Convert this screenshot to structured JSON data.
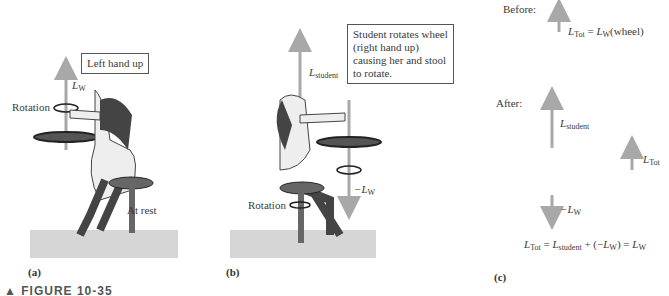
{
  "panel_a": {
    "letter": "(a)",
    "callout": "Left hand up",
    "rotation_label": "Rotation",
    "vector_label": "L",
    "vector_sub": "W",
    "state_label": "At rest"
  },
  "panel_b": {
    "letter": "(b)",
    "callout_lines": [
      "Student rotates wheel",
      "(right hand up)",
      "causing her and stool",
      "to rotate."
    ],
    "student_vector": "L",
    "student_sub": "student",
    "wheel_vector": "−L",
    "wheel_sub": "W",
    "rotation_label": "Rotation"
  },
  "panel_c": {
    "letter": "(c)",
    "before_label": "Before:",
    "before_eq": {
      "lhs": "L",
      "lhs_sub": "Tot",
      "eq": "=",
      "rhs": "L",
      "rhs_sub": "W",
      "rhs_suffix": "(wheel)"
    },
    "after_label": "After:",
    "student_vector": "L",
    "student_sub": "student",
    "tot_vector": "L",
    "tot_sub": "Tot",
    "neg_vector": "−L",
    "neg_sub": "W",
    "final_eq": {
      "a": "L",
      "a_sub": "Tot",
      "b": "= ",
      "c": "L",
      "c_sub": "student",
      "d": " + (−",
      "e": "L",
      "e_sub": "W",
      "f": ") = ",
      "g": "L",
      "g_sub": "W"
    }
  },
  "caption": "▲ FIGURE 10-35",
  "colors": {
    "arrow": "#a8a8a8",
    "floor": "#d6d6d6",
    "text": "#3a3a3a"
  }
}
